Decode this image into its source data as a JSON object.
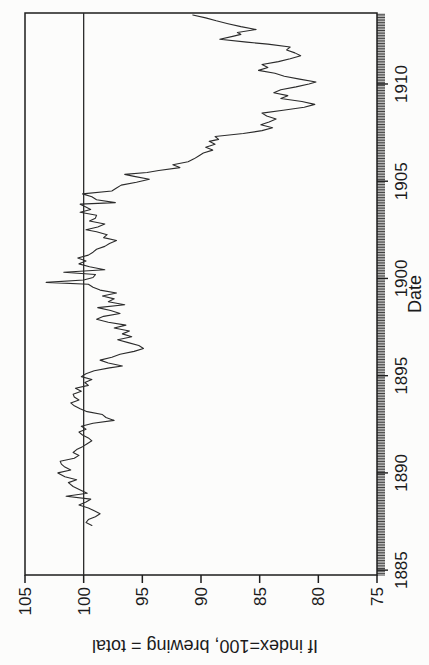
{
  "figure": {
    "background_color": "#fcfcfb",
    "axis_color": "#1d1d1d",
    "line_color": "#2b2b2b",
    "rotation": "chart rotated 90 degrees counterclockwise on page"
  },
  "chart_data": {
    "type": "line",
    "title": "",
    "xlabel": "Date",
    "ylabel": "If index=100, brewing = total",
    "xlim": [
      1884.75,
      1913.65
    ],
    "ylim": [
      75,
      105
    ],
    "x_tick_years": [
      1885,
      1890,
      1895,
      1900,
      1905,
      1910
    ],
    "x_minor_tick_interval": "monthly",
    "y_ticks": [
      75,
      80,
      85,
      90,
      95,
      100,
      105
    ],
    "reference_line_y": 100,
    "grid": "off",
    "legend": "none",
    "series": [
      {
        "name": "brewing share index relative to total (=100)",
        "points": [
          [
            1887.3,
            99.3
          ],
          [
            1887.45,
            99.8
          ],
          [
            1887.6,
            99.6
          ],
          [
            1887.75,
            99.0
          ],
          [
            1887.9,
            98.6
          ],
          [
            1888.05,
            99.1
          ],
          [
            1888.2,
            99.6
          ],
          [
            1888.35,
            100.4
          ],
          [
            1888.5,
            99.8
          ],
          [
            1888.65,
            99.4
          ],
          [
            1888.8,
            101.5
          ],
          [
            1888.95,
            99.7
          ],
          [
            1889.1,
            100.2
          ],
          [
            1889.3,
            100.9
          ],
          [
            1889.5,
            101.3
          ],
          [
            1889.65,
            100.6
          ],
          [
            1889.8,
            101.6
          ],
          [
            1890.0,
            102.2
          ],
          [
            1890.15,
            101.1
          ],
          [
            1890.3,
            101.6
          ],
          [
            1890.45,
            101.9
          ],
          [
            1890.6,
            102.0
          ],
          [
            1890.75,
            100.8
          ],
          [
            1890.9,
            100.4
          ],
          [
            1891.05,
            100.9
          ],
          [
            1891.2,
            100.6
          ],
          [
            1891.35,
            100.1
          ],
          [
            1891.5,
            99.7
          ],
          [
            1891.65,
            99.3
          ],
          [
            1891.8,
            99.6
          ],
          [
            1891.95,
            100.1
          ],
          [
            1892.1,
            100.4
          ],
          [
            1892.25,
            99.8
          ],
          [
            1892.4,
            100.2
          ],
          [
            1892.55,
            99.2
          ],
          [
            1892.7,
            97.4
          ],
          [
            1892.85,
            98.1
          ],
          [
            1893.0,
            98.4
          ],
          [
            1893.15,
            99.7
          ],
          [
            1893.3,
            100.3
          ],
          [
            1893.45,
            100.8
          ],
          [
            1893.6,
            101.1
          ],
          [
            1893.75,
            100.4
          ],
          [
            1893.9,
            100.8
          ],
          [
            1894.05,
            100.9
          ],
          [
            1894.2,
            100.2
          ],
          [
            1894.35,
            100.7
          ],
          [
            1894.5,
            99.6
          ],
          [
            1894.65,
            99.9
          ],
          [
            1894.8,
            99.3
          ],
          [
            1894.95,
            100.2
          ],
          [
            1895.1,
            99.8
          ],
          [
            1895.25,
            99.1
          ],
          [
            1895.4,
            97.8
          ],
          [
            1895.5,
            96.7
          ],
          [
            1895.65,
            97.9
          ],
          [
            1895.8,
            98.6
          ],
          [
            1895.95,
            97.6
          ],
          [
            1896.1,
            96.9
          ],
          [
            1896.25,
            95.7
          ],
          [
            1896.4,
            94.9
          ],
          [
            1896.55,
            95.3
          ],
          [
            1896.7,
            96.2
          ],
          [
            1896.85,
            97.1
          ],
          [
            1897.0,
            95.9
          ],
          [
            1897.15,
            96.7
          ],
          [
            1897.3,
            96.1
          ],
          [
            1897.45,
            97.4
          ],
          [
            1897.6,
            96.4
          ],
          [
            1897.75,
            97.9
          ],
          [
            1897.9,
            98.9
          ],
          [
            1898.05,
            98.3
          ],
          [
            1898.2,
            96.9
          ],
          [
            1898.35,
            97.7
          ],
          [
            1898.5,
            98.8
          ],
          [
            1898.65,
            96.5
          ],
          [
            1898.8,
            97.9
          ],
          [
            1898.95,
            97.4
          ],
          [
            1899.1,
            98.4
          ],
          [
            1899.25,
            97.2
          ],
          [
            1899.4,
            98.6
          ],
          [
            1899.55,
            99.2
          ],
          [
            1899.7,
            99.6
          ],
          [
            1899.8,
            103.2
          ],
          [
            1899.92,
            100.0
          ],
          [
            1900.05,
            99.2
          ],
          [
            1900.2,
            99.0
          ],
          [
            1900.32,
            101.7
          ],
          [
            1900.45,
            98.2
          ],
          [
            1900.6,
            99.5
          ],
          [
            1900.75,
            100.4
          ],
          [
            1900.9,
            99.8
          ],
          [
            1901.05,
            100.5
          ],
          [
            1901.2,
            99.6
          ],
          [
            1901.35,
            99.2
          ],
          [
            1901.5,
            98.9
          ],
          [
            1901.65,
            98.2
          ],
          [
            1901.8,
            97.8
          ],
          [
            1901.95,
            97.2
          ],
          [
            1902.1,
            98.3
          ],
          [
            1902.25,
            98.0
          ],
          [
            1902.4,
            98.9
          ],
          [
            1902.5,
            99.8
          ],
          [
            1902.65,
            98.8
          ],
          [
            1902.8,
            98.2
          ],
          [
            1902.95,
            99.5
          ],
          [
            1903.1,
            99.0
          ],
          [
            1903.25,
            98.9
          ],
          [
            1903.4,
            100.3
          ],
          [
            1903.55,
            99.4
          ],
          [
            1903.7,
            99.9
          ],
          [
            1903.82,
            100.3
          ],
          [
            1903.9,
            97.3
          ],
          [
            1904.05,
            98.9
          ],
          [
            1904.2,
            99.3
          ],
          [
            1904.35,
            100.1
          ],
          [
            1904.5,
            97.6
          ],
          [
            1904.65,
            97.2
          ],
          [
            1904.8,
            96.8
          ],
          [
            1904.95,
            95.5
          ],
          [
            1905.1,
            94.4
          ],
          [
            1905.25,
            95.7
          ],
          [
            1905.35,
            96.5
          ],
          [
            1905.45,
            94.6
          ],
          [
            1905.55,
            93.6
          ],
          [
            1905.7,
            91.8
          ],
          [
            1905.85,
            92.4
          ],
          [
            1906.0,
            91.1
          ],
          [
            1906.15,
            90.6
          ],
          [
            1906.3,
            90.2
          ],
          [
            1906.45,
            89.8
          ],
          [
            1906.6,
            89.0
          ],
          [
            1906.75,
            89.6
          ],
          [
            1906.9,
            88.8
          ],
          [
            1907.05,
            89.3
          ],
          [
            1907.15,
            88.5
          ],
          [
            1907.3,
            88.8
          ],
          [
            1907.45,
            86.4
          ],
          [
            1907.6,
            84.8
          ],
          [
            1907.75,
            83.9
          ],
          [
            1907.9,
            84.9
          ],
          [
            1908.05,
            84.2
          ],
          [
            1908.2,
            83.6
          ],
          [
            1908.35,
            84.4
          ],
          [
            1908.5,
            84.8
          ],
          [
            1908.65,
            83.0
          ],
          [
            1908.8,
            81.2
          ],
          [
            1908.95,
            80.3
          ],
          [
            1909.1,
            81.4
          ],
          [
            1909.25,
            83.2
          ],
          [
            1909.4,
            82.6
          ],
          [
            1909.55,
            83.8
          ],
          [
            1909.7,
            83.2
          ],
          [
            1909.85,
            81.9
          ],
          [
            1910.0,
            80.8
          ],
          [
            1910.1,
            80.2
          ],
          [
            1910.25,
            81.6
          ],
          [
            1910.4,
            82.9
          ],
          [
            1910.55,
            83.7
          ],
          [
            1910.7,
            85.1
          ],
          [
            1910.85,
            84.3
          ],
          [
            1911.0,
            84.8
          ],
          [
            1911.15,
            83.4
          ],
          [
            1911.3,
            82.4
          ],
          [
            1911.45,
            81.5
          ],
          [
            1911.6,
            82.0
          ],
          [
            1911.75,
            82.7
          ],
          [
            1911.9,
            82.4
          ],
          [
            1912.05,
            84.3
          ],
          [
            1912.15,
            86.1
          ],
          [
            1912.3,
            88.4
          ],
          [
            1912.45,
            87.3
          ],
          [
            1912.55,
            86.6
          ],
          [
            1912.65,
            86.9
          ],
          [
            1912.8,
            85.3
          ],
          [
            1912.95,
            86.6
          ],
          [
            1913.1,
            87.7
          ],
          [
            1913.25,
            88.7
          ],
          [
            1913.4,
            89.6
          ],
          [
            1913.55,
            90.7
          ]
        ]
      }
    ]
  }
}
